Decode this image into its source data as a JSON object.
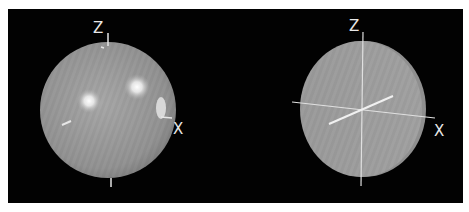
{
  "figure": {
    "background": "#020202",
    "page_background": "#ffffff",
    "sphere_color": "#9a9a9a",
    "axis_color": "#e6e6e6",
    "left_view": {
      "description": "Shaded sphere with two specular highlights and a bright blob near X axis",
      "labels": {
        "z": "Z",
        "x": "X"
      }
    },
    "right_view": {
      "description": "Flat disc with intersecting coordinate axes",
      "labels": {
        "z": "Z",
        "x": "X"
      }
    }
  }
}
